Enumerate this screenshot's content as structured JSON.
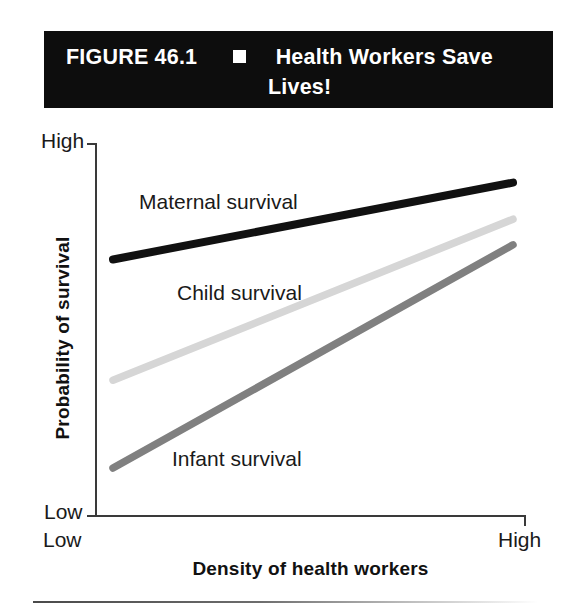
{
  "figure": {
    "number_label": "FIGURE 46.1",
    "separator_icon": "white-square-bullet",
    "title_line_1": "Health Workers Save",
    "title_line_2": "Lives!",
    "banner_background": "#0d0d0d",
    "banner_text_color": "#ffffff"
  },
  "chart_data": {
    "type": "line",
    "title": "Health Workers Save Lives!",
    "xlabel": "Density of health workers",
    "ylabel": "Probability of survival",
    "x_tick_labels": [
      "Low",
      "High"
    ],
    "y_tick_labels": [
      "Low",
      "High"
    ],
    "xlim": [
      "Low",
      "High"
    ],
    "ylim": [
      "Low",
      "High"
    ],
    "grid": false,
    "legend_position": "inline-labels",
    "x": [
      0,
      1
    ],
    "series": [
      {
        "name": "Maternal survival",
        "color": "#111111",
        "line_width": 8,
        "values": [
          0.69,
          0.9
        ],
        "label_position": {
          "x": 139,
          "y": 190
        }
      },
      {
        "name": "Child survival",
        "color": "#d6d6d6",
        "line_width": 7.5,
        "values": [
          0.36,
          0.8
        ],
        "label_position": {
          "x": 177,
          "y": 281
        }
      },
      {
        "name": "Infant survival",
        "color": "#808080",
        "line_width": 7.5,
        "values": [
          0.12,
          0.73
        ],
        "label_position": {
          "x": 172,
          "y": 447
        }
      }
    ]
  },
  "axes": {
    "y_top_tick": "High",
    "y_bottom_tick": "Low",
    "x_left_tick": "Low",
    "x_right_tick": "High",
    "axis_color": "#3a3a3a"
  }
}
